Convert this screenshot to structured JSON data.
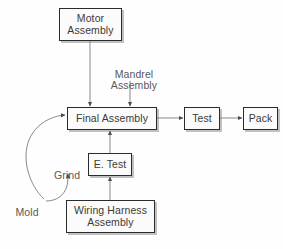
{
  "diagram": {
    "background_color": "#fefefe",
    "line_color": "#6b6b6b",
    "box_border_color": "#2b2b2b",
    "box_fill_color": "#fbfbfb",
    "text_color": "#3a3a3a",
    "nodes": [
      {
        "id": "motor_assembly",
        "label": "Motor\nAssembly",
        "type": "box"
      },
      {
        "id": "mandrel_assembly",
        "label": "Mandrel\nAssembly",
        "type": "label"
      },
      {
        "id": "final_assembly",
        "label": "Final Assembly",
        "type": "box"
      },
      {
        "id": "test",
        "label": "Test",
        "type": "box"
      },
      {
        "id": "pack",
        "label": "Pack",
        "type": "box"
      },
      {
        "id": "grind",
        "label": "Grind",
        "type": "label"
      },
      {
        "id": "e_test",
        "label": "E. Test",
        "type": "box"
      },
      {
        "id": "mold",
        "label": "Mold",
        "type": "label"
      },
      {
        "id": "wiring_harness",
        "label": "Wiring Harness\nAssembly",
        "type": "box"
      }
    ],
    "edges": [
      {
        "from": "motor_assembly",
        "to": "final_assembly",
        "style": "straight"
      },
      {
        "from": "mandrel_assembly",
        "to": "final_assembly",
        "style": "straight"
      },
      {
        "from": "final_assembly",
        "to": "test",
        "style": "straight"
      },
      {
        "from": "test",
        "to": "pack",
        "style": "straight"
      },
      {
        "from": "e_test",
        "to": "final_assembly",
        "style": "straight"
      },
      {
        "from": "wiring_harness",
        "to": "e_test",
        "style": "straight"
      },
      {
        "from": "mold",
        "to": "final_assembly",
        "style": "curved"
      },
      {
        "from": "mold",
        "to": "grind",
        "style": "curved"
      }
    ]
  }
}
